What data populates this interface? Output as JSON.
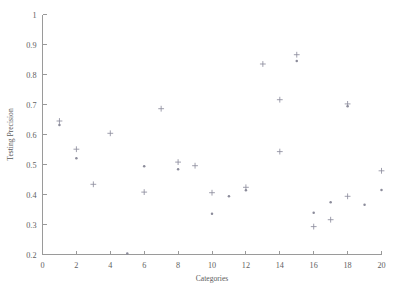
{
  "chart_data": {
    "type": "scatter",
    "title": "",
    "xlabel": "Categories",
    "ylabel": "Testing Precision",
    "xlim": [
      0,
      20
    ],
    "ylim": [
      0.2,
      1
    ],
    "xticks": [
      0,
      2,
      4,
      6,
      8,
      10,
      12,
      14,
      16,
      18,
      20
    ],
    "xtick_labels": [
      "0",
      "2",
      "4",
      "6",
      "8",
      "10",
      "12",
      "14",
      "16",
      "18",
      "20"
    ],
    "yticks": [
      0.2,
      0.3,
      0.4,
      0.5,
      0.6,
      0.7,
      0.8,
      0.9,
      1
    ],
    "ytick_labels": [
      "0.2",
      "0.3",
      "0.4",
      "0.5",
      "0.6",
      "0.7",
      "0.8",
      "0.9",
      "1"
    ],
    "grid": false,
    "legend": "none",
    "marker": "plus",
    "marker_color": "#8e8e9e",
    "points": [
      {
        "x": 1,
        "y": 0.645,
        "style": "plus"
      },
      {
        "x": 1,
        "y": 0.632,
        "style": "dot"
      },
      {
        "x": 2,
        "y": 0.551,
        "style": "plus"
      },
      {
        "x": 2,
        "y": 0.521,
        "style": "dot"
      },
      {
        "x": 3,
        "y": 0.434,
        "style": "plus"
      },
      {
        "x": 4,
        "y": 0.604,
        "style": "plus"
      },
      {
        "x": 5,
        "y": 0.203,
        "style": "dot"
      },
      {
        "x": 6,
        "y": 0.494,
        "style": "dot"
      },
      {
        "x": 6,
        "y": 0.408,
        "style": "plus"
      },
      {
        "x": 7,
        "y": 0.686,
        "style": "plus"
      },
      {
        "x": 8,
        "y": 0.508,
        "style": "plus"
      },
      {
        "x": 8,
        "y": 0.484,
        "style": "dot"
      },
      {
        "x": 9,
        "y": 0.496,
        "style": "plus"
      },
      {
        "x": 10,
        "y": 0.406,
        "style": "plus"
      },
      {
        "x": 10,
        "y": 0.336,
        "style": "dot"
      },
      {
        "x": 11,
        "y": 0.394,
        "style": "dot"
      },
      {
        "x": 12,
        "y": 0.424,
        "style": "plus"
      },
      {
        "x": 12,
        "y": 0.414,
        "style": "dot"
      },
      {
        "x": 13,
        "y": 0.835,
        "style": "plus"
      },
      {
        "x": 14,
        "y": 0.716,
        "style": "plus"
      },
      {
        "x": 14,
        "y": 0.543,
        "style": "plus"
      },
      {
        "x": 15,
        "y": 0.866,
        "style": "plus"
      },
      {
        "x": 15,
        "y": 0.845,
        "style": "dot"
      },
      {
        "x": 16,
        "y": 0.339,
        "style": "dot"
      },
      {
        "x": 16,
        "y": 0.293,
        "style": "plus"
      },
      {
        "x": 17,
        "y": 0.374,
        "style": "dot"
      },
      {
        "x": 17,
        "y": 0.316,
        "style": "plus"
      },
      {
        "x": 18,
        "y": 0.702,
        "style": "plus"
      },
      {
        "x": 18,
        "y": 0.694,
        "style": "dot"
      },
      {
        "x": 18,
        "y": 0.394,
        "style": "plus"
      },
      {
        "x": 19,
        "y": 0.366,
        "style": "dot"
      },
      {
        "x": 20,
        "y": 0.479,
        "style": "plus"
      },
      {
        "x": 20,
        "y": 0.415,
        "style": "dot"
      }
    ]
  }
}
